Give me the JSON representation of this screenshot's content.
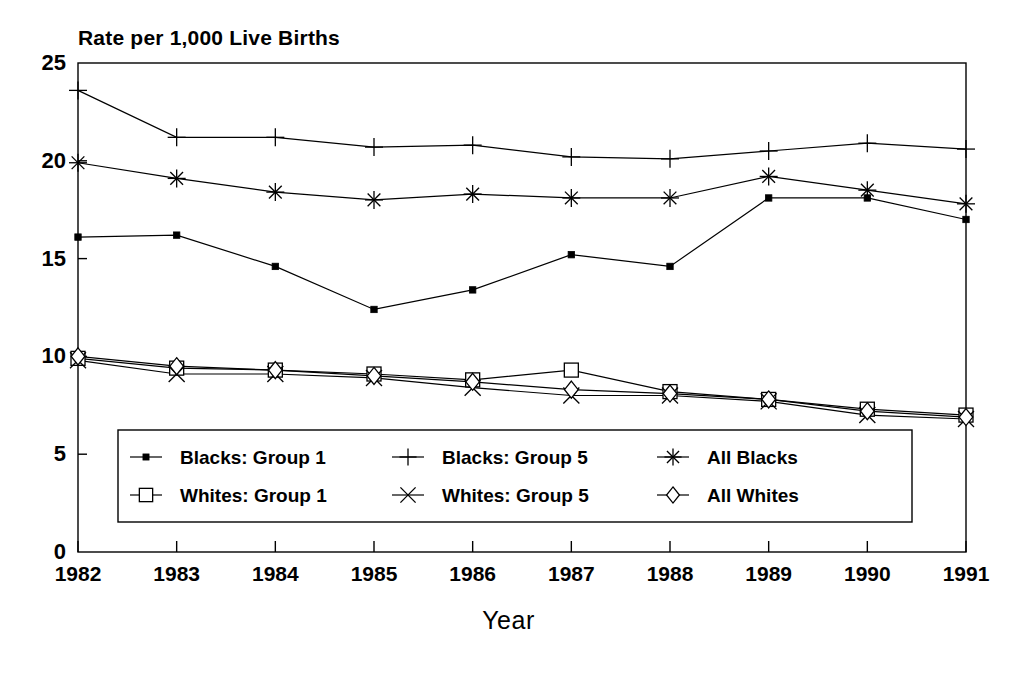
{
  "chart_data": {
    "type": "line",
    "title": "Rate per 1,000 Live Births",
    "xlabel": "Year",
    "ylabel": "",
    "x": [
      1982,
      1983,
      1984,
      1985,
      1986,
      1987,
      1988,
      1989,
      1990,
      1991
    ],
    "categories": [
      "1982",
      "1983",
      "1984",
      "1985",
      "1986",
      "1987",
      "1988",
      "1989",
      "1990",
      "1991"
    ],
    "ylim": [
      0,
      25
    ],
    "yticks": [
      0,
      5,
      10,
      15,
      20,
      25
    ],
    "xlim": [
      1982,
      1991
    ],
    "grid": false,
    "legend_position": "inside-bottom-left",
    "series": [
      {
        "name": "Blacks: Group 1",
        "marker": "filled-square",
        "values": [
          16.1,
          16.2,
          14.6,
          12.4,
          13.4,
          15.2,
          14.6,
          18.1,
          18.1,
          17.0
        ]
      },
      {
        "name": "Blacks: Group 5",
        "marker": "plus",
        "values": [
          23.6,
          21.2,
          21.2,
          20.7,
          20.8,
          20.2,
          20.1,
          20.5,
          20.9,
          20.6
        ]
      },
      {
        "name": "All Blacks",
        "marker": "asterisk",
        "values": [
          19.9,
          19.1,
          18.4,
          18.0,
          18.3,
          18.1,
          18.1,
          19.2,
          18.5,
          17.8
        ]
      },
      {
        "name": "Whites: Group 1",
        "marker": "open-square",
        "values": [
          9.9,
          9.4,
          9.3,
          9.1,
          8.8,
          9.3,
          8.2,
          7.8,
          7.3,
          7.0
        ]
      },
      {
        "name": "Whites: Group 5",
        "marker": "x-cross",
        "values": [
          9.8,
          9.1,
          9.1,
          8.9,
          8.4,
          8.0,
          8.0,
          7.7,
          7.0,
          6.8
        ]
      },
      {
        "name": "All Whites",
        "marker": "diamond",
        "values": [
          10.0,
          9.5,
          9.3,
          9.0,
          8.7,
          8.3,
          8.1,
          7.8,
          7.2,
          6.9
        ]
      }
    ],
    "legend": [
      "Blacks: Group 1",
      "Blacks: Group 5",
      "All Blacks",
      "Whites: Group 1",
      "Whites: Group 5",
      "All Whites"
    ],
    "colors": {
      "line": "#000000",
      "axis": "#000000",
      "background": "#ffffff"
    }
  },
  "plot_geometry": {
    "left": 78,
    "right": 966,
    "top": 63,
    "bottom": 552
  },
  "legend_box": {
    "left": 118,
    "top": 430,
    "width": 794,
    "height": 92
  }
}
